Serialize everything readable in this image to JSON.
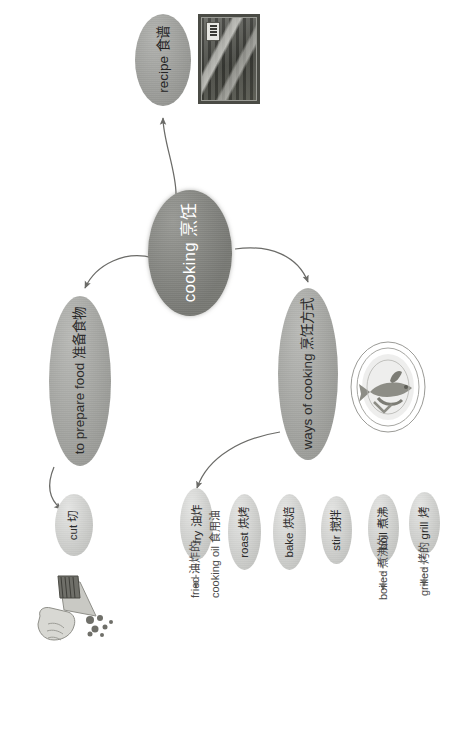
{
  "diagram": {
    "orientation": "rotated-90-ccw",
    "palette": {
      "background": "#ffffff",
      "central_node": "#8b8c87",
      "branch_node": "#a9aaa6",
      "leaf_node": "#cfd0cd",
      "arrow": "#6b6b68",
      "text_light": "#ffffff",
      "text_dark": "#2b2b2b",
      "plain_text": "#4a4a4a"
    }
  },
  "nodes": {
    "central": {
      "en": "cooking",
      "zh": "烹饪",
      "label": "cooking 烹饪"
    },
    "recipe": {
      "en": "recipe",
      "zh": "食谱",
      "label": "recipe 食谱"
    },
    "prepare": {
      "en": "to prepare food",
      "zh": "准备食物",
      "label": "to prepare food 准备食物"
    },
    "ways": {
      "en": "ways of cooking",
      "zh": "烹饪方式",
      "label": "ways of cooking 烹饪方式"
    }
  },
  "leaves": [
    {
      "id": "cut",
      "en": "cut",
      "zh": "切",
      "label": "cut 切"
    },
    {
      "id": "fry",
      "en": "fry",
      "zh": "油炸",
      "label": "fry 油炸"
    },
    {
      "id": "roast",
      "en": "roast",
      "zh": "烘烤",
      "label": "roast 烘烤"
    },
    {
      "id": "bake",
      "en": "bake",
      "zh": "烘焙",
      "label": "bake 烘焙"
    },
    {
      "id": "stir",
      "en": "stir",
      "zh": "搅拌",
      "label": "stir 搅拌"
    },
    {
      "id": "boil",
      "en": "boil",
      "zh": "煮沸",
      "label": "boil 煮沸"
    },
    {
      "id": "grill",
      "en": "grill",
      "zh": "烤",
      "label": "grill 烤"
    }
  ],
  "derived": [
    {
      "id": "fried",
      "en": "fried",
      "zh": "油炸的",
      "label": "fried 油炸的",
      "from": "fry"
    },
    {
      "id": "cooking_oil",
      "en": "cooking oil",
      "zh": "食用油",
      "label": "cooking oil 食用油",
      "from": "fry"
    },
    {
      "id": "boiled",
      "en": "boiled",
      "zh": "煮沸的",
      "label": "boiled 煮沸的",
      "from": "boil"
    },
    {
      "id": "grilled",
      "en": "grilled",
      "zh": "烤的",
      "label": "grilled 烤的",
      "from": "grill"
    }
  ],
  "images": [
    {
      "id": "recipe-photo",
      "name": "recipe-book-photo",
      "alt": "recipe book cover photograph"
    },
    {
      "id": "fish-plate",
      "name": "cooked-fish-plate-illustration",
      "alt": "cooked fish on an oval plate"
    },
    {
      "id": "hand-knife",
      "name": "hand-cutting-with-knife-illustration",
      "alt": "hand holding a knife cutting food"
    }
  ],
  "edges": [
    {
      "from": "central",
      "to": "recipe",
      "style": "solid-arrow"
    },
    {
      "from": "central",
      "to": "prepare",
      "style": "solid-arrow"
    },
    {
      "from": "central",
      "to": "ways",
      "style": "solid-arrow"
    },
    {
      "from": "prepare",
      "to": "cut",
      "style": "solid-arrow"
    },
    {
      "from": "ways",
      "to": "fry",
      "style": "solid-arrow"
    },
    {
      "from": "fry",
      "to": "fried",
      "style": "dashed-arrow"
    },
    {
      "from": "boil",
      "to": "boiled",
      "style": "dashed-arrow"
    },
    {
      "from": "grill",
      "to": "grilled",
      "style": "dashed-arrow"
    }
  ]
}
